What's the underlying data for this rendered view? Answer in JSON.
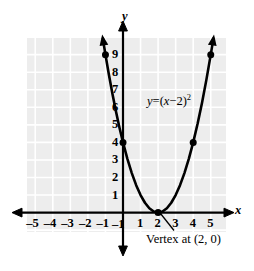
{
  "chart_data": {
    "type": "line",
    "title": "",
    "equation_label": "y = (x − 2)²",
    "equation_parts": {
      "lhs": "y",
      "eq": "=",
      "open": "(",
      "var": "x",
      "minus": "−",
      "const": "2",
      "close": ")",
      "exponent": "2"
    },
    "annotation": "Vertex at (2, 0)",
    "xlabel": "x",
    "ylabel": "y",
    "xlim": [
      -5.5,
      5.6
    ],
    "ylim": [
      -1.6,
      10.2
    ],
    "grid": true,
    "legend": "none",
    "xticks": [
      -5,
      -4,
      -3,
      -2,
      -1,
      1,
      2,
      3,
      4,
      5
    ],
    "xtick_labels": [
      "–5",
      "–4",
      "–3",
      "–2",
      "–1",
      "1",
      "2",
      "3",
      "4",
      "5"
    ],
    "yticks": [
      -1,
      1,
      2,
      3,
      4,
      5,
      6,
      7,
      8,
      9
    ],
    "ytick_labels": [
      "–1",
      "1",
      "2",
      "3",
      "4",
      "5",
      "6",
      "7",
      "8",
      "9"
    ],
    "vertex": {
      "x": 2,
      "y": 0
    },
    "marked_points": [
      {
        "x": -1,
        "y": 9
      },
      {
        "x": 0,
        "y": 4
      },
      {
        "x": 2,
        "y": 0
      },
      {
        "x": 4,
        "y": 4
      },
      {
        "x": 5,
        "y": 9
      }
    ],
    "curve": {
      "function": "y = (x - 2)^2",
      "x": [
        -1.15,
        -1.0,
        -0.8,
        -0.6,
        -0.4,
        -0.2,
        0.0,
        0.25,
        0.5,
        0.75,
        1.0,
        1.25,
        1.5,
        1.75,
        2.0,
        2.25,
        2.5,
        2.75,
        3.0,
        3.25,
        3.5,
        3.75,
        4.0,
        4.25,
        4.5,
        4.75,
        5.0,
        5.15
      ],
      "y": [
        9.92,
        9.0,
        7.84,
        6.76,
        5.76,
        4.84,
        4.0,
        3.0625,
        2.25,
        1.5625,
        1.0,
        0.5625,
        0.25,
        0.0625,
        0.0,
        0.0625,
        0.25,
        0.5625,
        1.0,
        1.5625,
        2.25,
        3.0625,
        4.0,
        5.0625,
        6.25,
        7.5625,
        9.0,
        9.9225
      ]
    },
    "colors": {
      "curve": "#000000",
      "axis": "#000000",
      "grid_background": "#ededed",
      "grid_lines": "#ffffff",
      "point": "#000000",
      "text": "#000000"
    }
  }
}
